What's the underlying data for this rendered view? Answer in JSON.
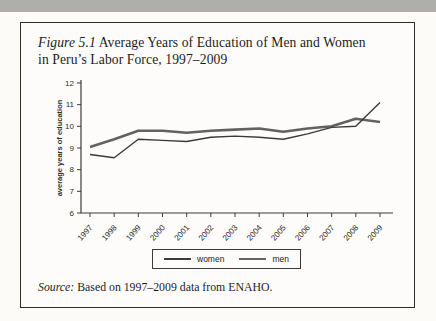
{
  "figure": {
    "title": {
      "prefix": "Figure 5.1",
      "line1_rest": " Average Years of Education of Men and Women",
      "line2": "in Peru’s Labor Force, 1997–2009"
    },
    "source": {
      "prefix": "Source:",
      "rest": " Based on 1997–2009 data from ENAHO."
    },
    "legend": {
      "women_label": "women",
      "men_label": "men"
    }
  },
  "chart_data": {
    "type": "line",
    "title": "Figure 5.1 Average Years of Education of Men and Women in Peru’s Labor Force, 1997–2009",
    "x": [
      1997,
      1998,
      1999,
      2000,
      2001,
      2002,
      2003,
      2004,
      2005,
      2006,
      2007,
      2008,
      2009
    ],
    "series": [
      {
        "name": "women",
        "color": "#3a3a3a",
        "stroke_width": 1.4,
        "values": [
          8.7,
          8.55,
          9.4,
          9.35,
          9.3,
          9.5,
          9.55,
          9.5,
          9.4,
          9.65,
          9.95,
          10.0,
          11.1
        ]
      },
      {
        "name": "men",
        "color": "#626262",
        "stroke_width": 2.6,
        "values": [
          9.05,
          9.4,
          9.8,
          9.8,
          9.7,
          9.8,
          9.85,
          9.9,
          9.75,
          9.9,
          10.0,
          10.35,
          10.2
        ]
      }
    ],
    "xlabel": "",
    "ylabel": "average years of education",
    "ylim": [
      6,
      12
    ],
    "yticks": [
      6,
      7,
      8,
      9,
      10,
      11,
      12
    ],
    "grid": false,
    "legend_position": "bottom",
    "axis_color": "#3d3d3d"
  }
}
